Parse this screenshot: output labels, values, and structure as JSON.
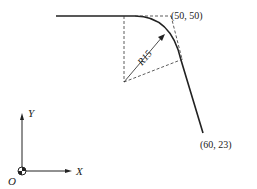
{
  "diagram": {
    "labels": {
      "point_top": "(50, 50)",
      "point_bottom": "(60, 23)",
      "radius": "R15",
      "axis_x": "X",
      "axis_y": "Y",
      "origin": "O"
    },
    "colors": {
      "stroke": "#222222",
      "background": "#ffffff"
    }
  }
}
